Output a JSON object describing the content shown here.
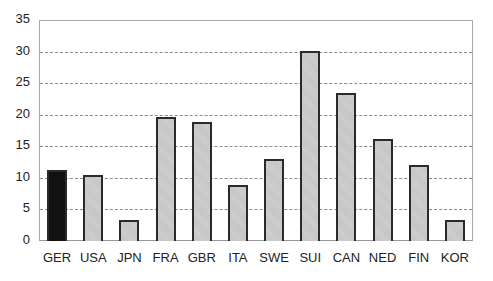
{
  "chart_data": {
    "type": "bar",
    "title": "",
    "xlabel": "",
    "ylabel": "",
    "categories": [
      "GER",
      "USA",
      "JPN",
      "FRA",
      "GBR",
      "ITA",
      "SWE",
      "SUI",
      "CAN",
      "NED",
      "FIN",
      "KOR"
    ],
    "values": [
      11.2,
      10.4,
      3.4,
      19.6,
      18.9,
      8.9,
      13.0,
      30.1,
      23.4,
      16.2,
      12.0,
      3.3
    ],
    "ylim": [
      0,
      35
    ],
    "yticks": [
      0,
      5,
      10,
      15,
      20,
      25,
      30,
      35
    ],
    "grid": true,
    "grid_style": "dashed horizontal",
    "legend": null,
    "highlight": {
      "category": "GER",
      "color": "#111111"
    },
    "colors": {
      "bar": "#c8c8c8",
      "bar_border": "#2a2a2a",
      "highlight": "#111111",
      "grid": "#8a8a8a",
      "axis": "#a8a8a8"
    }
  }
}
